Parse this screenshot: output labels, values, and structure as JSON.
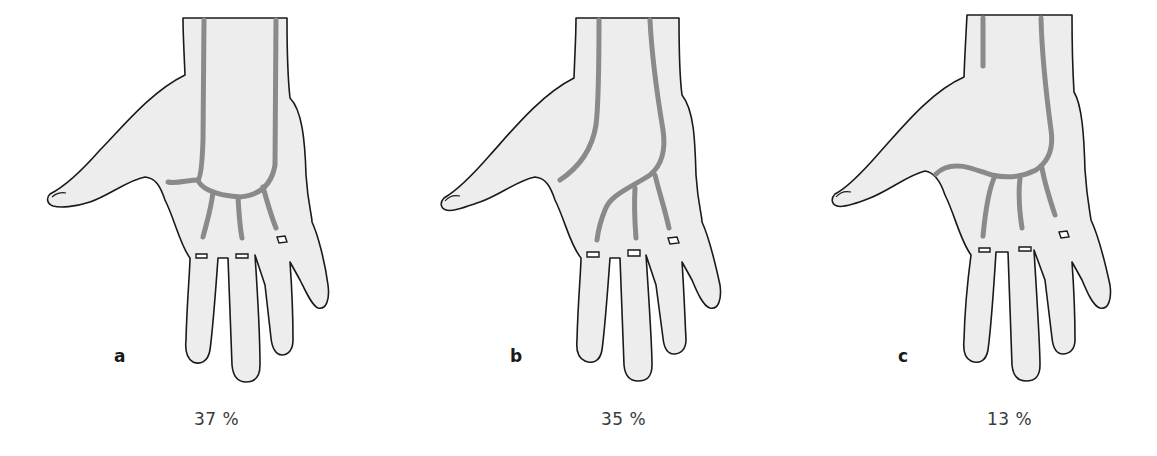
{
  "figure": {
    "colors": {
      "background": "#ffffff",
      "skin": "#ededed",
      "outline": "#1a1a1a",
      "vessel": "#8a8a8a",
      "label_text": "#1a1a1a",
      "percent_text": "#3a3a3a"
    },
    "panels": [
      {
        "letter": "a",
        "percent": "37 %",
        "variant": "complete-superficial-arch-from-radial-and-ulnar"
      },
      {
        "letter": "b",
        "percent": "35 %",
        "variant": "ulnar-arch-without-radial-connection"
      },
      {
        "letter": "c",
        "percent": "13 %",
        "variant": "ulnar-arch-with-incomplete-radial-branch"
      }
    ]
  }
}
